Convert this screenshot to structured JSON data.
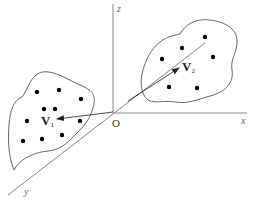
{
  "diagram": {
    "axes": {
      "x_label": "x",
      "y_label": "y",
      "z_label": "z",
      "origin_label": "O"
    },
    "vectors": [
      {
        "name": "V",
        "subscript": "1",
        "cluster": "left"
      },
      {
        "name": "V",
        "subscript": "2",
        "cluster": "right"
      }
    ],
    "clusters": [
      {
        "name": "left",
        "point_count": 10
      },
      {
        "name": "right",
        "point_count": 6
      }
    ],
    "colors": {
      "axis": "#888888",
      "outline": "#555555",
      "points": "#000000"
    }
  }
}
